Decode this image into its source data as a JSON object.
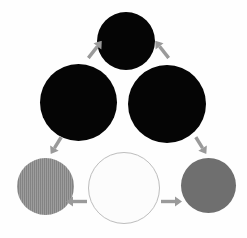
{
  "figure": {
    "type": "diagram",
    "name": "six-circle-cycle-diagram",
    "background_color": "#fefefe",
    "width": 247,
    "height": 238,
    "arrow_color": "#9a9a9a"
  },
  "nodes": [
    {
      "id": "top-circle",
      "name": "top-black-circle",
      "position": "top-center",
      "x": 97,
      "y": 12,
      "diameter": 58,
      "fill": "#050505",
      "stroke": "none",
      "texture": "solid",
      "tone": "black"
    },
    {
      "id": "left-circle",
      "name": "left-black-circle",
      "position": "middle-left",
      "x": 40,
      "y": 64,
      "diameter": 77,
      "fill": "#050505",
      "stroke": "none",
      "texture": "solid",
      "tone": "black"
    },
    {
      "id": "right-circle",
      "name": "right-black-circle",
      "position": "middle-right",
      "x": 128,
      "y": 65,
      "diameter": 78,
      "fill": "#050505",
      "stroke": "none",
      "texture": "solid",
      "tone": "black"
    },
    {
      "id": "bottom-left-circle",
      "name": "bottom-left-gray-circle",
      "position": "bottom-left",
      "x": 17,
      "y": 158,
      "diameter": 57,
      "fill": "#8a8a8a",
      "stroke": "none",
      "texture": "vertical-stripes",
      "tone": "medium-gray"
    },
    {
      "id": "bottom-center-circle",
      "name": "bottom-center-white-circle",
      "position": "bottom-center",
      "x": 88,
      "y": 152,
      "diameter": 72,
      "fill": "#fcfcfc",
      "stroke": "#bdbdbd",
      "texture": "solid",
      "tone": "white"
    },
    {
      "id": "bottom-right-circle",
      "name": "bottom-right-gray-circle",
      "position": "bottom-right",
      "x": 181,
      "y": 158,
      "diameter": 55,
      "fill": "#6f6f6f",
      "stroke": "none",
      "texture": "solid",
      "tone": "dark-gray"
    }
  ],
  "arrows": [
    {
      "id": "arrow-left-up",
      "name": "arrow-left-up-to-top",
      "from": "left-circle",
      "to": "top-circle",
      "direction": "up-right",
      "x": 84,
      "y": 44,
      "length": 22,
      "angle": -52,
      "color": "#9a9a9a"
    },
    {
      "id": "arrow-right-up",
      "name": "arrow-right-up-to-top",
      "from": "right-circle",
      "to": "top-circle",
      "direction": "up-left",
      "x": 151,
      "y": 44,
      "length": 22,
      "angle": -128,
      "color": "#9a9a9a"
    },
    {
      "id": "arrow-down-left",
      "name": "arrow-down-to-bottom-left",
      "from": "left-circle",
      "to": "bottom-left-circle",
      "direction": "down-left",
      "x": 46,
      "y": 140,
      "length": 20,
      "angle": 122,
      "color": "#9a9a9a"
    },
    {
      "id": "arrow-down-right",
      "name": "arrow-down-to-bottom-right",
      "from": "right-circle",
      "to": "bottom-right-circle",
      "direction": "down-right",
      "x": 191,
      "y": 140,
      "length": 20,
      "angle": 58,
      "color": "#9a9a9a"
    },
    {
      "id": "arrow-center-left",
      "name": "arrow-center-to-bottom-left",
      "from": "bottom-center-circle",
      "to": "bottom-left-circle",
      "direction": "left",
      "x": 66,
      "y": 196,
      "length": 21,
      "angle": 180,
      "color": "#9a9a9a"
    },
    {
      "id": "arrow-center-right",
      "name": "arrow-center-to-bottom-right",
      "from": "bottom-center-circle",
      "to": "bottom-right-circle",
      "direction": "right",
      "x": 161,
      "y": 196,
      "length": 21,
      "angle": 0,
      "color": "#9a9a9a"
    }
  ]
}
